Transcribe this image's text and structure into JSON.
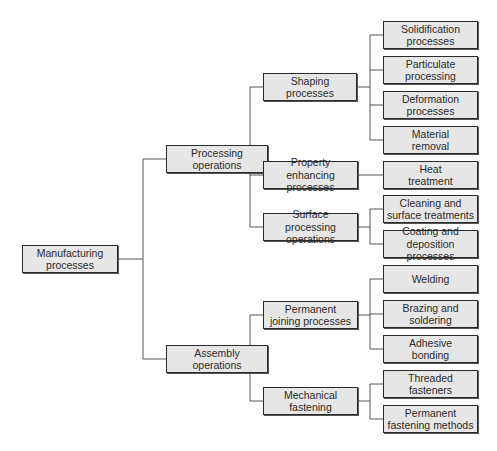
{
  "diagram": {
    "root": {
      "label": "Manufacturing\nprocesses"
    },
    "level1": [
      {
        "label": "Processing\noperations"
      },
      {
        "label": "Assembly\noperations"
      }
    ],
    "level2": [
      {
        "label": "Shaping\nprocesses"
      },
      {
        "label": "Property\nenhancing processes"
      },
      {
        "label": "Surface processing\noperations"
      },
      {
        "label": "Permanent\njoining processes"
      },
      {
        "label": "Mechanical\nfastening"
      }
    ],
    "level3": [
      {
        "label": "Solidification\nprocesses"
      },
      {
        "label": "Particulate\nprocessing"
      },
      {
        "label": "Deformation\nprocesses"
      },
      {
        "label": "Material\nremoval"
      },
      {
        "label": "Heat\ntreatment"
      },
      {
        "label": "Cleaning and\nsurface treatments"
      },
      {
        "label": "Coating and\ndeposition processes"
      },
      {
        "label": "Welding"
      },
      {
        "label": "Brazing and\nsoldering"
      },
      {
        "label": "Adhesive\nbonding"
      },
      {
        "label": "Threaded\nfasteners"
      },
      {
        "label": "Permanent\nfastening methods"
      }
    ]
  },
  "colors": {
    "box_fill": "#e6e6e6",
    "box_border": "#2a2a2a",
    "connector": "#555555",
    "text": "#2b2b2b"
  }
}
